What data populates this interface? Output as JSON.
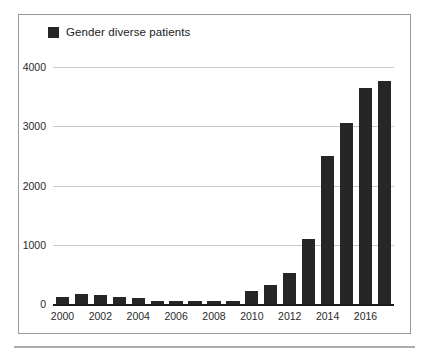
{
  "chart_data": {
    "type": "bar",
    "title": "",
    "subtitle": "",
    "xlabel": "",
    "ylabel": "",
    "legend": [
      {
        "label": "Gender diverse patients",
        "color": "#262626"
      }
    ],
    "legend_position": "top-left",
    "grid": true,
    "grid_axis": "y",
    "ylim": [
      0,
      4000
    ],
    "yticks": [
      0,
      1000,
      2000,
      3000,
      4000
    ],
    "ytick_labels": [
      "0",
      "1000",
      "2000",
      "3000",
      "4000"
    ],
    "categories": [
      "2000",
      "2001",
      "2002",
      "2003",
      "2004",
      "2005",
      "2006",
      "2007",
      "2008",
      "2009",
      "2010",
      "2011",
      "2012",
      "2013",
      "2014",
      "2015",
      "2016",
      "2017"
    ],
    "xtick_labels_shown": [
      "2000",
      "",
      "2002",
      "",
      "2004",
      "",
      "2006",
      "",
      "2008",
      "",
      "2010",
      "",
      "2012",
      "",
      "2014",
      "",
      "2016",
      ""
    ],
    "series": [
      {
        "name": "Gender diverse patients",
        "color": "#262626",
        "values": [
          115,
          175,
          160,
          125,
          95,
          55,
          50,
          45,
          50,
          55,
          225,
          320,
          520,
          1100,
          2490,
          3060,
          3640,
          3770
        ]
      }
    ]
  },
  "colors": {
    "bar": "#262626",
    "gridline": "#c9c9c9",
    "axis": "#1a1a1a",
    "frame": "#9a9a9a",
    "rule": "#aaaaaa",
    "text": "#2a2a2a",
    "background": "#ffffff"
  }
}
